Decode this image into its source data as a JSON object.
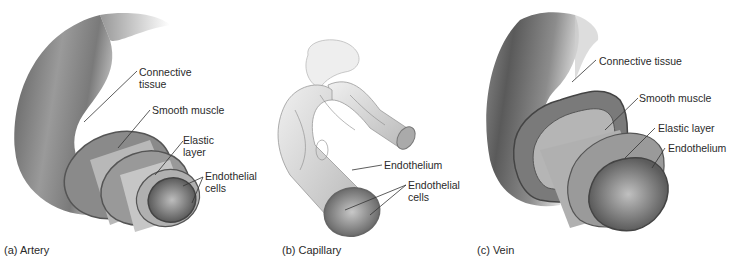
{
  "figure": {
    "panels": [
      {
        "id": "artery",
        "caption": "(a) Artery",
        "labels": {
          "connective_tissue": "Connective\ntissue",
          "connective_1": "Connective",
          "connective_2": "tissue",
          "smooth_muscle": "Smooth muscle",
          "elastic_1": "Elastic",
          "elastic_2": "layer",
          "endothelial_1": "Endothelial",
          "endothelial_2": "cells"
        }
      },
      {
        "id": "capillary",
        "caption": "(b) Capillary",
        "labels": {
          "endothelium": "Endothelium",
          "endothelial_1": "Endothelial",
          "endothelial_2": "cells"
        }
      },
      {
        "id": "vein",
        "caption": "(c) Vein",
        "labels": {
          "connective_tissue": "Connective tissue",
          "smooth_muscle": "Smooth muscle",
          "elastic_layer": "Elastic layer",
          "endothelium": "Endothelium"
        }
      }
    ],
    "colors": {
      "background": "#ffffff",
      "vessel_dark": "#6e6e6e",
      "vessel_mid": "#a8a8a8",
      "vessel_light": "#d8d8d8",
      "leader_line": "#333333"
    }
  }
}
